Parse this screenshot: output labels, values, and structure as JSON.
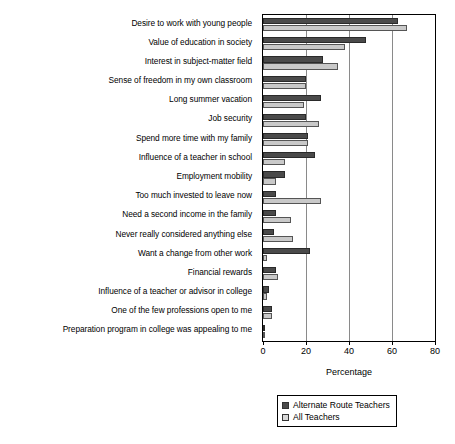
{
  "chart_data": {
    "type": "bar",
    "orientation": "horizontal",
    "title": "",
    "xlabel": "Percentage",
    "ylabel": "",
    "xlim": [
      0,
      80
    ],
    "xticks": [
      0,
      20,
      40,
      60,
      80
    ],
    "grid": true,
    "legend_position": "bottom-right",
    "categories": [
      "Desire to work with young people",
      "Value of education in society",
      "Interest in subject-matter field",
      "Sense of freedom in my own classroom",
      "Long summer vacation",
      "Job security",
      "Spend more time with my family",
      "Influence of a teacher in school",
      "Employment mobility",
      "Too much invested to leave now",
      "Need a second income in the family",
      "Never really considered anything else",
      "Want a change from other work",
      "Financial rewards",
      "Influence of a teacher or advisor in college",
      "One of the few professions open to me",
      "Preparation program in college was appealing to me"
    ],
    "series": [
      {
        "name": "Alternate Route Teachers",
        "color": "#4a4a4a",
        "values": [
          63,
          48,
          28,
          20,
          27,
          20,
          21,
          24,
          10,
          6,
          6,
          5,
          22,
          6,
          3,
          4,
          1
        ]
      },
      {
        "name": "All Teachers",
        "color": "#c9c9c9",
        "values": [
          67,
          38,
          35,
          20,
          19,
          26,
          21,
          10,
          6,
          27,
          13,
          14,
          2,
          7,
          2,
          4,
          1
        ]
      }
    ]
  }
}
